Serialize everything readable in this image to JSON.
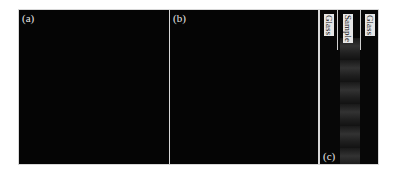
{
  "figure": {
    "panels": [
      {
        "id": "a",
        "label": "(a)"
      },
      {
        "id": "b",
        "label": "(b)"
      },
      {
        "id": "c",
        "label": "(c)",
        "layers": [
          "Glass",
          "Sample",
          "Glass"
        ]
      }
    ],
    "colors": {
      "background": "#050505",
      "frame": "#d8d8d8",
      "text": "#e8e8e8"
    }
  }
}
